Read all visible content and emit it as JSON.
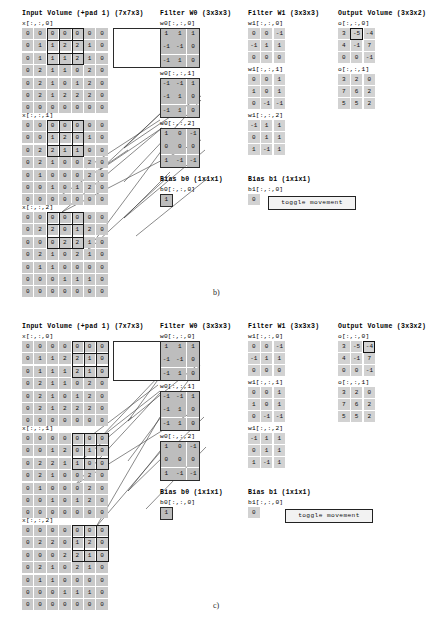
{
  "figure": {
    "panels": [
      {
        "id": "b",
        "caption": "b)"
      },
      {
        "id": "c",
        "caption": "c)"
      }
    ]
  },
  "headers": {
    "input": "Input Volume (+pad 1) (7x7x3)",
    "filter_w0": "Filter W0 (3x3x3)",
    "filter_w1": "Filter W1 (3x3x3)",
    "output": "Output Volume (3x3x2)",
    "bias_b0": "Bias b0 (1x1x1)",
    "bias_b1": "Bias b1 (1x1x1)"
  },
  "labels": {
    "x0": "x[:,:,0]",
    "x1": "x[:,:,1]",
    "x2": "x[:,:,2]",
    "w0_0": "w0[:,:,0]",
    "w0_1": "w0[:,:,1]",
    "w0_2": "w0[:,:,2]",
    "w1_0": "w1[:,:,0]",
    "w1_1": "w1[:,:,1]",
    "w1_2": "w1[:,:,2]",
    "b0": "b0[:,:,0]",
    "b1": "b1[:,:,0]",
    "o0": "o[:,:,0]",
    "o1": "o[:,:,1]"
  },
  "controls": {
    "toggle_label": "toggle movement"
  },
  "chart_data": {
    "type": "table",
    "input_volume": {
      "shape": [
        7,
        7,
        3
      ],
      "slices": [
        {
          "name": "x[:,:,0]",
          "values": [
            [
              0,
              0,
              0,
              0,
              0,
              0,
              0
            ],
            [
              0,
              1,
              1,
              2,
              2,
              1,
              0
            ],
            [
              0,
              1,
              1,
              1,
              2,
              1,
              0
            ],
            [
              0,
              2,
              1,
              1,
              0,
              2,
              0
            ],
            [
              0,
              2,
              1,
              0,
              1,
              2,
              0
            ],
            [
              0,
              2,
              1,
              2,
              2,
              2,
              0
            ],
            [
              0,
              0,
              0,
              0,
              0,
              0,
              0
            ]
          ]
        },
        {
          "name": "x[:,:,1]",
          "values": [
            [
              0,
              0,
              0,
              0,
              0,
              0,
              0
            ],
            [
              0,
              0,
              1,
              2,
              0,
              1,
              0
            ],
            [
              0,
              2,
              2,
              1,
              1,
              0,
              0
            ],
            [
              0,
              2,
              1,
              0,
              0,
              2,
              0
            ],
            [
              0,
              1,
              0,
              0,
              0,
              2,
              0
            ],
            [
              0,
              0,
              1,
              0,
              1,
              2,
              0
            ],
            [
              0,
              0,
              0,
              0,
              0,
              0,
              0
            ]
          ]
        },
        {
          "name": "x[:,:,2]",
          "values": [
            [
              0,
              0,
              0,
              0,
              0,
              0,
              0
            ],
            [
              0,
              2,
              2,
              0,
              1,
              2,
              0
            ],
            [
              0,
              0,
              0,
              2,
              2,
              1,
              0
            ],
            [
              0,
              2,
              1,
              0,
              2,
              1,
              0
            ],
            [
              0,
              1,
              1,
              0,
              0,
              0,
              0
            ],
            [
              0,
              0,
              0,
              1,
              1,
              1,
              0
            ],
            [
              0,
              0,
              0,
              0,
              0,
              0,
              0
            ]
          ]
        }
      ]
    },
    "filter_w0": {
      "shape": [
        3,
        3,
        3
      ],
      "slices": [
        {
          "name": "w0[:,:,0]",
          "values": [
            [
              1,
              1,
              1
            ],
            [
              -1,
              -1,
              0
            ],
            [
              -1,
              1,
              0
            ]
          ]
        },
        {
          "name": "w0[:,:,1]",
          "values": [
            [
              -1,
              -1,
              1
            ],
            [
              -1,
              1,
              0
            ],
            [
              -1,
              1,
              0
            ]
          ]
        },
        {
          "name": "w0[:,:,2]",
          "values": [
            [
              1,
              0,
              -1
            ],
            [
              0,
              0,
              0
            ],
            [
              1,
              -1,
              -1
            ]
          ]
        }
      ],
      "bias": {
        "name": "b0[:,:,0]",
        "values": [
          [
            1
          ]
        ]
      }
    },
    "filter_w1": {
      "shape": [
        3,
        3,
        3
      ],
      "slices": [
        {
          "name": "w1[:,:,0]",
          "values": [
            [
              0,
              0,
              -1
            ],
            [
              -1,
              1,
              1
            ],
            [
              0,
              0,
              0
            ]
          ]
        },
        {
          "name": "w1[:,:,1]",
          "values": [
            [
              0,
              0,
              1
            ],
            [
              1,
              0,
              1
            ],
            [
              0,
              -1,
              -1
            ]
          ]
        },
        {
          "name": "w1[:,:,2]",
          "values": [
            [
              -1,
              1,
              1
            ],
            [
              0,
              1,
              1
            ],
            [
              1,
              -1,
              1
            ]
          ]
        }
      ],
      "bias": {
        "name": "b1[:,:,0]",
        "values": [
          [
            0
          ]
        ]
      }
    },
    "output_volume": {
      "shape": [
        3,
        3,
        2
      ],
      "slices": [
        {
          "name": "o[:,:,0]",
          "values": [
            [
              3,
              -5,
              -4
            ],
            [
              4,
              -1,
              7
            ],
            [
              0,
              0,
              -1
            ]
          ]
        },
        {
          "name": "o[:,:,1]",
          "values": [
            [
              3,
              2,
              0
            ],
            [
              7,
              6,
              2
            ],
            [
              5,
              5,
              2
            ]
          ]
        }
      ]
    },
    "panel_b": {
      "receptive_field_cols": [
        2,
        3,
        4
      ],
      "receptive_field_rows": [
        0,
        1,
        2
      ],
      "highlighted_output": {
        "slice": "o[:,:,0]",
        "row": 0,
        "col": 1,
        "value": -5
      }
    },
    "panel_c": {
      "receptive_field_cols": [
        4,
        5,
        6
      ],
      "receptive_field_rows": [
        0,
        1,
        2
      ],
      "highlighted_output": {
        "slice": "o[:,:,0]",
        "row": 0,
        "col": 2,
        "value": -4
      }
    }
  }
}
